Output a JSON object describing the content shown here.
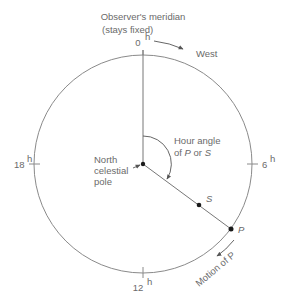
{
  "diagram": {
    "title_line1": "Observer's meridian",
    "title_line2": "(stays fixed)",
    "hour_marks": {
      "top": "0",
      "right": "6",
      "bottom": "12",
      "left": "18",
      "unit_superscript": "h"
    },
    "direction_label": "West",
    "pole_label_line1": "North",
    "pole_label_line2": "celestial",
    "pole_label_line3": "pole",
    "hour_angle_line1": "Hour angle",
    "hour_angle_line2_prefix": "of ",
    "hour_angle_P": "P",
    "hour_angle_or": " or ",
    "hour_angle_S": "S",
    "point_S": "S",
    "point_P": "P",
    "motion_label": "Motion of P",
    "colors": {
      "line": "#7a7a7a",
      "text": "#6a6a6a",
      "dot": "#1a1a1a"
    }
  }
}
